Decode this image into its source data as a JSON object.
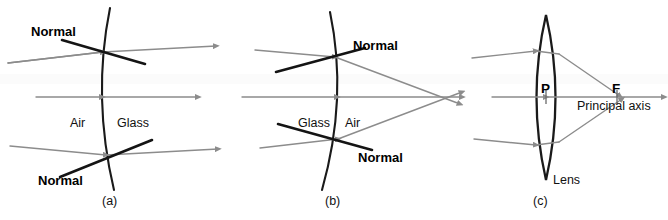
{
  "figure": {
    "background_color": "#ffffff",
    "ray_color": "#8c8c8c",
    "surface_color": "#1a1a1a",
    "normal_color": "#141414"
  },
  "panels": [
    {
      "id": "a",
      "caption": "(a)",
      "labels": {
        "normal_top": "Normal",
        "normal_bottom": "Normal",
        "medium_left": "Air",
        "medium_right": "Glass"
      }
    },
    {
      "id": "b",
      "caption": "(b)",
      "labels": {
        "normal_top": "Normal",
        "normal_bottom": "Normal",
        "medium_left": "Glass",
        "medium_right": "Air"
      }
    },
    {
      "id": "c",
      "caption": "(c)",
      "labels": {
        "pole": "P",
        "focus": "F",
        "axis": "Principal axis",
        "lens": "Lens"
      }
    }
  ]
}
